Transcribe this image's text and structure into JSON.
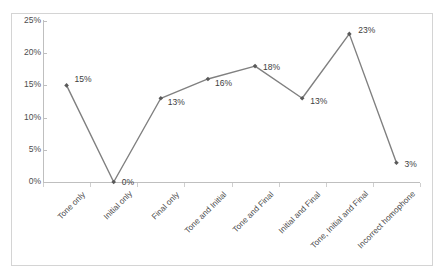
{
  "chart_data": {
    "type": "line",
    "title": "",
    "subtitle": "",
    "xlabel": "",
    "ylabel": "",
    "categories": [
      "Tone only",
      "Initial only",
      "Final only",
      "Tone and Initial",
      "Tone and Final",
      "Initial and Final",
      "Tone, Initial and Final",
      "Incorrect homophone"
    ],
    "values": [
      15,
      0,
      13,
      16,
      18,
      13,
      23,
      3
    ],
    "data_labels": [
      "15%",
      "0%",
      "13%",
      "16%",
      "18%",
      "13%",
      "23%",
      "3%"
    ],
    "ylim": [
      0,
      25
    ],
    "ytick_values": [
      0,
      5,
      10,
      15,
      20,
      25
    ],
    "ytick_labels": [
      "0%",
      "5%",
      "10%",
      "15%",
      "20%",
      "25%"
    ],
    "grid": false,
    "legend": false,
    "legend_position": "none",
    "series": [
      {
        "name": "",
        "values": [
          15,
          0,
          13,
          16,
          18,
          13,
          23,
          3
        ],
        "line_color": "#808080",
        "marker_color": "#595959",
        "marker": "diamond"
      }
    ],
    "colors": {
      "line": "#808080",
      "marker": "#595959",
      "axis": "#bfbfbf",
      "text": "#4a4a4a",
      "label_text": "#3d3d3d",
      "border": "#d4d4d4",
      "background": "#ffffff"
    }
  }
}
